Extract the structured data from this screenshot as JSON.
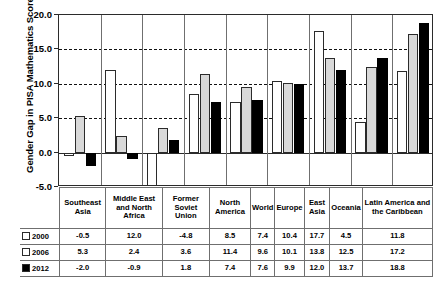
{
  "chart_data": {
    "type": "bar",
    "title": "",
    "xlabel": "",
    "ylabel": "Gender Gap in PISA Mathematics Scores",
    "ylim": [
      -5.0,
      20.0
    ],
    "yticks": [
      -5.0,
      0.0,
      5.0,
      10.0,
      15.0,
      20.0
    ],
    "ytick_labels": [
      "-5.0",
      "0.0",
      "5.0",
      "10.0",
      "15.0",
      "20.0"
    ],
    "grid": "horizontal dashed at 5.0, 10.0, 15.0; solid zero line at 0.0",
    "legend_position": "table-row-labels",
    "categories": [
      "Southeast Asia",
      "Middle East and North Africa",
      "Former Soviet Union",
      "North America",
      "World",
      "Europe",
      "East Asia",
      "Oceania",
      "Latin America and the Caribbean"
    ],
    "series": [
      {
        "name": "2000",
        "color": "#ffffff",
        "values": [
          -0.5,
          12.0,
          -4.8,
          8.5,
          7.4,
          10.4,
          17.7,
          4.5,
          11.8
        ]
      },
      {
        "name": "2006",
        "color": "#d9d9d9",
        "values": [
          5.3,
          2.4,
          3.6,
          11.4,
          9.6,
          10.1,
          13.8,
          12.5,
          17.2
        ]
      },
      {
        "name": "2012",
        "color": "#000000",
        "values": [
          -2.0,
          -0.9,
          1.8,
          7.4,
          7.6,
          9.9,
          12.0,
          13.7,
          18.8
        ]
      }
    ]
  },
  "table": {
    "column_headers": [
      "Southeast Asia",
      "Middle East and North Africa",
      "Former Soviet Union",
      "North America",
      "World",
      "Europe",
      "East Asia",
      "Oceania",
      "Latin America and the Caribbean"
    ],
    "rows": [
      {
        "label": "2000",
        "swatch": "white-square-icon",
        "values": [
          "-0.5",
          "12.0",
          "-4.8",
          "8.5",
          "7.4",
          "10.4",
          "17.7",
          "4.5",
          "11.8"
        ]
      },
      {
        "label": "2006",
        "swatch": "white-square-icon",
        "values": [
          "5.3",
          "2.4",
          "3.6",
          "11.4",
          "9.6",
          "10.1",
          "13.8",
          "12.5",
          "17.2"
        ]
      },
      {
        "label": "2012",
        "swatch": "black-square-icon",
        "values": [
          "-2.0",
          "-0.9",
          "1.8",
          "7.4",
          "7.6",
          "9.9",
          "12.0",
          "13.7",
          "18.8"
        ]
      }
    ]
  }
}
